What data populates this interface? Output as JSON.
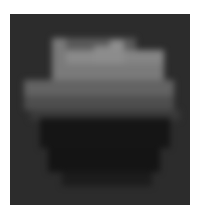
{
  "image": {
    "description": "Pixelated low-resolution grayscale image: dark square containing a lighter irregular top band over a dark bowl shape",
    "background": "#2c2c2c",
    "cell_size": 12,
    "blocks": [
      {
        "x": 42,
        "y": 24,
        "w": 14,
        "h": 26,
        "c": "#7a7a7a"
      },
      {
        "x": 56,
        "y": 24,
        "w": 70,
        "h": 12,
        "c": "#5a5a5a"
      },
      {
        "x": 56,
        "y": 36,
        "w": 28,
        "h": 14,
        "c": "#8a8a8a"
      },
      {
        "x": 84,
        "y": 32,
        "w": 30,
        "h": 18,
        "c": "#8c8c8c"
      },
      {
        "x": 100,
        "y": 26,
        "w": 14,
        "h": 10,
        "c": "#8f8f8f"
      },
      {
        "x": 114,
        "y": 36,
        "w": 40,
        "h": 14,
        "c": "#858585"
      },
      {
        "x": 42,
        "y": 50,
        "w": 112,
        "h": 16,
        "c": "#7a7a7a"
      },
      {
        "x": 14,
        "y": 66,
        "w": 150,
        "h": 16,
        "c": "#636363"
      },
      {
        "x": 14,
        "y": 82,
        "w": 150,
        "h": 14,
        "c": "#4e4e4e"
      },
      {
        "x": 20,
        "y": 96,
        "w": 150,
        "h": 10,
        "c": "#3a3a3a"
      },
      {
        "x": 30,
        "y": 104,
        "w": 130,
        "h": 30,
        "c": "#151515"
      },
      {
        "x": 38,
        "y": 134,
        "w": 112,
        "h": 24,
        "c": "#141414"
      },
      {
        "x": 52,
        "y": 158,
        "w": 90,
        "h": 14,
        "c": "#1c1c1c"
      }
    ]
  }
}
